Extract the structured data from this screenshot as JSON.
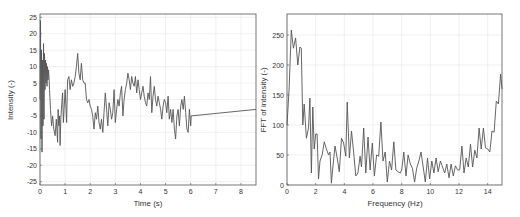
{
  "chart_data": [
    {
      "type": "line",
      "title": "",
      "xlabel": "Time (s)",
      "ylabel": "Intensity (-)",
      "xlim": [
        0,
        8.6
      ],
      "ylim": [
        -26,
        26
      ],
      "xticks": [
        0,
        1,
        2,
        3,
        4,
        5,
        6,
        7,
        8
      ],
      "yticks": [
        -25,
        -20,
        -15,
        -10,
        -5,
        0,
        5,
        10,
        15,
        20,
        25
      ],
      "grid": true,
      "series": [
        {
          "name": "Intensity",
          "color": "#555555",
          "x": [
            0,
            0.02,
            0.04,
            0.06,
            0.08,
            0.1,
            0.12,
            0.14,
            0.16,
            0.18,
            0.2,
            0.22,
            0.24,
            0.26,
            0.28,
            0.3,
            0.32,
            0.34,
            0.36,
            0.38,
            0.4,
            0.42,
            0.44,
            0.46,
            0.5,
            0.55,
            0.6,
            0.65,
            0.7,
            0.72,
            0.75,
            0.78,
            0.8,
            0.83,
            0.86,
            0.9,
            0.93,
            0.96,
            1.0,
            1.03,
            1.06,
            1.1,
            1.15,
            1.2,
            1.25,
            1.3,
            1.35,
            1.4,
            1.45,
            1.5,
            1.55,
            1.6,
            1.65,
            1.7,
            1.75,
            1.8,
            1.85,
            1.9,
            1.95,
            2.0,
            2.05,
            2.1,
            2.15,
            2.2,
            2.25,
            2.3,
            2.35,
            2.4,
            2.45,
            2.5,
            2.55,
            2.6,
            2.65,
            2.7,
            2.75,
            2.8,
            2.85,
            2.9,
            2.95,
            3.0,
            3.05,
            3.1,
            3.15,
            3.2,
            3.25,
            3.3,
            3.35,
            3.4,
            3.45,
            3.5,
            3.55,
            3.6,
            3.65,
            3.7,
            3.75,
            3.8,
            3.85,
            3.9,
            3.95,
            4.0,
            4.05,
            4.1,
            4.15,
            4.2,
            4.25,
            4.3,
            4.35,
            4.4,
            4.45,
            4.5,
            4.55,
            4.6,
            4.65,
            4.7,
            4.75,
            4.8,
            4.85,
            4.9,
            4.95,
            5.0,
            5.05,
            5.1,
            5.15,
            5.2,
            5.25,
            5.3,
            5.35,
            5.4,
            5.45,
            5.5,
            5.55,
            5.6,
            5.65,
            5.7,
            5.75,
            5.8,
            5.85,
            5.9,
            5.95,
            6.0,
            6.02,
            8.6
          ],
          "y": [
            0,
            24,
            -12,
            15,
            -16,
            12,
            -8,
            17,
            -6,
            14,
            3,
            12,
            5,
            11,
            4,
            10,
            6,
            9,
            7,
            3,
            0,
            -3,
            -6,
            -8,
            -5,
            -9,
            -11,
            -6,
            -13,
            -3,
            -8,
            -5,
            -14,
            -6,
            -2,
            2,
            -7,
            -3,
            3,
            -2,
            -7,
            6,
            7,
            3,
            6,
            4,
            5,
            7,
            10,
            14,
            8,
            6,
            11,
            6,
            5,
            5,
            0,
            -1,
            0,
            -2,
            -3,
            -5,
            -9,
            -4,
            -6,
            -2,
            -7,
            -9,
            -6,
            -10,
            -4,
            2,
            -3,
            -8,
            -1,
            -3,
            -6,
            -4,
            3,
            -7,
            -3,
            0,
            -2,
            2,
            4,
            -5,
            0,
            3,
            5,
            8,
            6,
            3,
            7,
            5,
            4,
            7,
            2,
            6,
            3,
            0,
            2,
            4,
            1,
            -1,
            -2,
            2,
            0,
            7,
            -4,
            1,
            4,
            0,
            -2,
            1,
            -1,
            -3,
            -6,
            -2,
            0,
            -1,
            -4,
            1,
            -6,
            -3,
            -7,
            -3,
            -9,
            -12,
            -5,
            -3,
            -8,
            -2,
            0,
            -3,
            1,
            -4,
            -9,
            -10,
            -3,
            -8,
            -5,
            -3,
            -9,
            0,
            0
          ],
          "hold_value": 0
        }
      ]
    },
    {
      "type": "line",
      "title": "",
      "xlabel": "Frequency (Hz)",
      "ylabel": "FFT of intensity (-)",
      "xlim": [
        0,
        15
      ],
      "ylim": [
        0,
        285
      ],
      "xticks": [
        0,
        2,
        4,
        6,
        8,
        10,
        12,
        14
      ],
      "yticks": [
        0,
        50,
        100,
        150,
        200,
        250
      ],
      "grid": true,
      "series": [
        {
          "name": "FFT",
          "color": "#555555",
          "x": [
            0,
            0.15,
            0.3,
            0.45,
            0.6,
            0.75,
            0.9,
            1.0,
            1.1,
            1.2,
            1.35,
            1.5,
            1.6,
            1.7,
            1.8,
            1.9,
            2.0,
            2.1,
            2.2,
            2.3,
            2.45,
            2.6,
            2.75,
            2.9,
            3.0,
            3.1,
            3.2,
            3.35,
            3.5,
            3.65,
            3.8,
            3.95,
            4.1,
            4.2,
            4.35,
            4.5,
            4.65,
            4.8,
            4.95,
            5.1,
            5.2,
            5.35,
            5.5,
            5.65,
            5.8,
            5.95,
            6.1,
            6.25,
            6.4,
            6.55,
            6.7,
            6.85,
            7.0,
            7.15,
            7.3,
            7.45,
            7.6,
            7.75,
            7.9,
            8.0,
            8.15,
            8.3,
            8.45,
            8.6,
            8.75,
            8.9,
            9.05,
            9.2,
            9.35,
            9.5,
            9.65,
            9.8,
            9.95,
            10.1,
            10.25,
            10.4,
            10.55,
            10.7,
            10.85,
            11.0,
            11.15,
            11.3,
            11.45,
            11.6,
            11.75,
            11.9,
            12.05,
            12.2,
            12.35,
            12.5,
            12.65,
            12.8,
            12.95,
            13.1,
            13.25,
            13.4,
            13.55,
            13.7,
            13.85,
            14.0,
            14.15,
            14.3,
            14.45,
            14.6,
            14.75,
            14.9,
            15.0
          ],
          "y": [
            100,
            160,
            258,
            228,
            245,
            200,
            230,
            228,
            100,
            135,
            78,
            95,
            145,
            20,
            130,
            60,
            85,
            85,
            10,
            40,
            50,
            72,
            60,
            50,
            55,
            3,
            30,
            65,
            45,
            22,
            78,
            70,
            48,
            138,
            45,
            90,
            55,
            15,
            20,
            48,
            30,
            95,
            20,
            80,
            25,
            70,
            15,
            50,
            48,
            105,
            40,
            55,
            5,
            40,
            25,
            72,
            25,
            22,
            20,
            25,
            55,
            15,
            50,
            35,
            28,
            5,
            28,
            40,
            55,
            30,
            5,
            45,
            10,
            40,
            20,
            45,
            22,
            40,
            30,
            20,
            35,
            12,
            35,
            15,
            32,
            25,
            25,
            65,
            20,
            45,
            30,
            68,
            30,
            58,
            45,
            95,
            60,
            95,
            62,
            60,
            55,
            90,
            88,
            140,
            135,
            185,
            160,
            150,
            185
          ]
        }
      ]
    }
  ]
}
